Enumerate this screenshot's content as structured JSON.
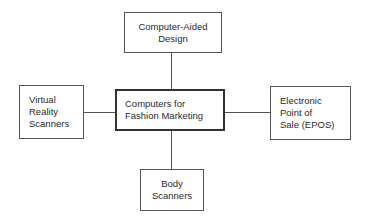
{
  "diagram": {
    "type": "hub-and-spoke",
    "center": {
      "lines": [
        "Computers for",
        "Fashion Marketing"
      ]
    },
    "nodes": {
      "top": {
        "lines": [
          "Computer-Aided",
          "Design"
        ]
      },
      "left": {
        "lines": [
          "Virtual",
          "Reality",
          "Scanners"
        ]
      },
      "right": {
        "lines": [
          "Electronic",
          "Point of",
          "Sale (EPOS)"
        ]
      },
      "bottom": {
        "lines": [
          "Body",
          "Scanners"
        ]
      }
    },
    "edges": [
      [
        "center",
        "top"
      ],
      [
        "center",
        "left"
      ],
      [
        "center",
        "right"
      ],
      [
        "center",
        "bottom"
      ]
    ]
  }
}
